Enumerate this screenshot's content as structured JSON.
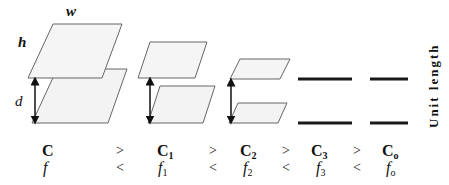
{
  "labels": {
    "width": "w",
    "height": "h",
    "distance": "d",
    "unit_length": "Unit length"
  },
  "capacitance_row": {
    "items": [
      {
        "base": "C",
        "sub": ""
      },
      {
        "base": "C",
        "sub": "1"
      },
      {
        "base": "C",
        "sub": "2"
      },
      {
        "base": "C",
        "sub": "3"
      },
      {
        "base": "C",
        "sub": "o"
      }
    ],
    "operator": ">"
  },
  "frequency_row": {
    "items": [
      {
        "base": "f",
        "sub": ""
      },
      {
        "base": "f",
        "sub": "1"
      },
      {
        "base": "f",
        "sub": "2"
      },
      {
        "base": "f",
        "sub": "3"
      },
      {
        "base": "f",
        "sub": "o"
      }
    ],
    "operator": "<"
  },
  "colors": {
    "plate_fill": "#f3f3f3",
    "plate_stroke": "#666666",
    "line": "#1a1a1a"
  }
}
